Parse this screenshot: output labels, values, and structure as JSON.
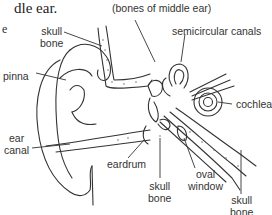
{
  "caption": {
    "line1": "dle ear.",
    "line2": "e"
  },
  "labels": {
    "ossicles": "(bones of middle ear)",
    "skull_bone_top_line1": "skull",
    "skull_bone_top_line2": "bone",
    "semicircular_canals": "semicircular canals",
    "pinna": "pinna",
    "cochlea": "cochlea",
    "ear_canal_line1": "ear",
    "ear_canal_line2": "canal",
    "eardrum": "eardrum",
    "oval_window_line1": "oval",
    "oval_window_line2": "window",
    "skull_bone_mid_line1": "skull",
    "skull_bone_mid_line2": "bone",
    "skull_bone_right_line1": "skull",
    "skull_bone_right_line2": "bone"
  },
  "colors": {
    "line": "#333333",
    "text": "#333333",
    "background": "#ffffff"
  }
}
